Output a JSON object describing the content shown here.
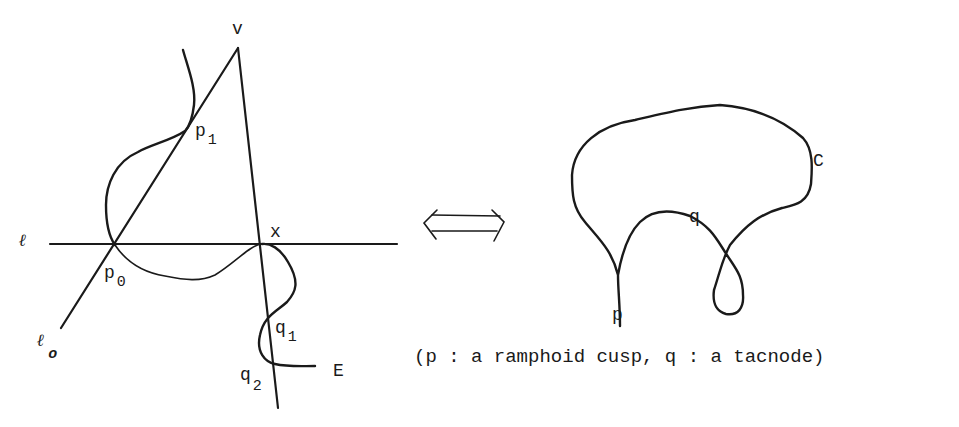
{
  "left_figure": {
    "labels": {
      "v": "v",
      "p1_base": "p",
      "p1_sub": "1",
      "l": "ℓ",
      "x": "x",
      "p0_base": "p",
      "p0_sub": "0",
      "l0_base": "ℓ",
      "l0_sub": "o",
      "q1_base": "q",
      "q1_sub": "1",
      "q2_base": "q",
      "q2_sub": "2",
      "E": "E"
    }
  },
  "equivalence_arrow": {
    "icon": "double-headed-implication-arrow",
    "glyph": "⟺"
  },
  "right_figure": {
    "labels": {
      "C": "C",
      "q": "q",
      "p": "p"
    },
    "caption": "(p : a ramphoid cusp, q : a tacnode)"
  },
  "colors": {
    "ink": "#1a1a1a",
    "background": "#ffffff"
  }
}
